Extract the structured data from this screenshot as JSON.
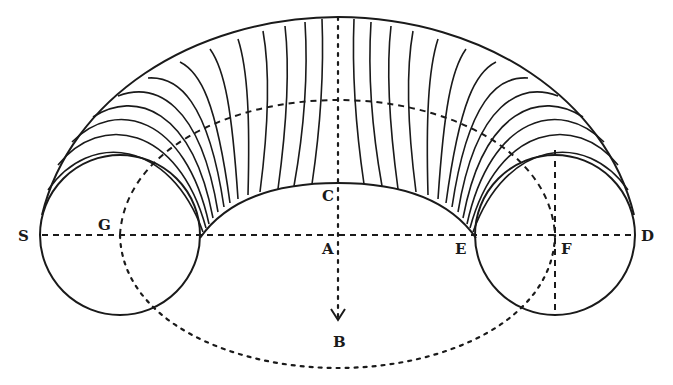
{
  "figure": {
    "colors": {
      "ink": "#1a1a1a",
      "background": "#ffffff"
    },
    "labels": {
      "S": "S",
      "G": "G",
      "C": "C",
      "A": "A",
      "E": "E",
      "F": "F",
      "D": "D",
      "B": "B"
    },
    "meridian_count": 30
  }
}
